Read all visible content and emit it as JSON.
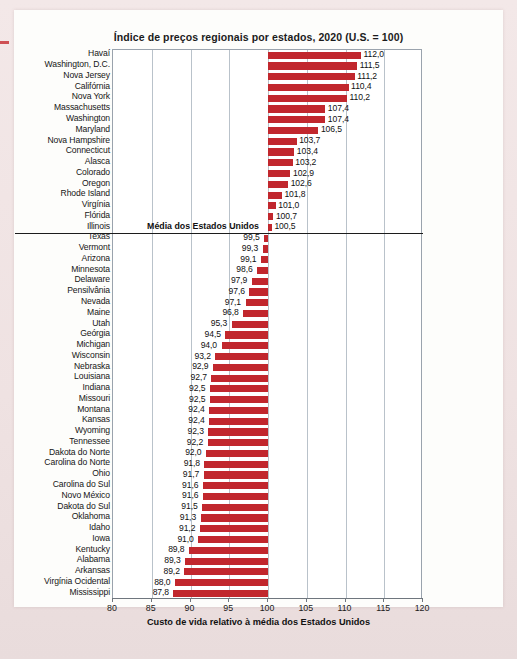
{
  "figure": {
    "title": "Índice de preços regionais por estados, 2020 (U.S. = 100)",
    "x_caption": "Custo de vida relativo à média dos Estados Unidos",
    "average_label": "Média dos Estados Unidos",
    "bar_color": "#c1272d",
    "grid_color": "#b9c2ca"
  },
  "chart_data": {
    "type": "bar",
    "orientation": "horizontal",
    "title": "Índice de preços regionais por estados, 2020 (U.S. = 100)",
    "xlabel": "Custo de vida relativo à média dos Estados Unidos",
    "ylabel": "",
    "xlim": [
      80,
      120
    ],
    "xticks": [
      80,
      85,
      90,
      95,
      100,
      105,
      110,
      115,
      120
    ],
    "xtick_labels": [
      "80",
      "85",
      "90",
      "95",
      "100",
      "105",
      "110",
      "115",
      "120"
    ],
    "baseline": 100,
    "grid": true,
    "legend": null,
    "annotations": [
      {
        "text": "Média dos Estados Unidos",
        "at_value": 100,
        "after_category": "Illinois"
      }
    ],
    "categories": [
      "Havaí",
      "Washington, D.C.",
      "Nova Jersey",
      "Califórnia",
      "Nova York",
      "Massachusetts",
      "Washington",
      "Maryland",
      "Nova Hampshire",
      "Connecticut",
      "Alasca",
      "Colorado",
      "Oregon",
      "Rhode Island",
      "Virgínia",
      "Flórida",
      "Illinois",
      "Texas",
      "Vermont",
      "Arizona",
      "Minnesota",
      "Delaware",
      "Pensilvânia",
      "Nevada",
      "Maine",
      "Utah",
      "Geórgia",
      "Michigan",
      "Wisconsin",
      "Nebraska",
      "Louisiana",
      "Indiana",
      "Missouri",
      "Montana",
      "Kansas",
      "Wyoming",
      "Tennessee",
      "Dakota do Norte",
      "Carolina do Norte",
      "Ohio",
      "Carolina do Sul",
      "Novo México",
      "Dakota do Sul",
      "Oklahoma",
      "Idaho",
      "Iowa",
      "Kentucky",
      "Alabama",
      "Arkansas",
      "Virgínia Ocidental",
      "Mississippi"
    ],
    "values": [
      112.0,
      111.5,
      111.2,
      110.4,
      110.2,
      107.4,
      107.4,
      106.5,
      103.7,
      103.4,
      103.2,
      102.9,
      102.6,
      101.8,
      101.0,
      100.7,
      100.5,
      99.5,
      99.3,
      99.1,
      98.6,
      97.9,
      97.6,
      97.1,
      96.8,
      95.3,
      94.5,
      94.0,
      93.2,
      92.9,
      92.7,
      92.5,
      92.5,
      92.4,
      92.4,
      92.3,
      92.2,
      92.0,
      91.8,
      91.7,
      91.6,
      91.6,
      91.5,
      91.3,
      91.2,
      91.0,
      89.8,
      89.3,
      89.2,
      88.0,
      87.8
    ],
    "value_labels": [
      "112,0",
      "111,5",
      "111,2",
      "110,4",
      "110,2",
      "107,4",
      "107,4",
      "106,5",
      "103,7",
      "103,4",
      "103,2",
      "102,9",
      "102,6",
      "101,8",
      "101,0",
      "100,7",
      "100,5",
      "99,5",
      "99,3",
      "99,1",
      "98,6",
      "97,9",
      "97,6",
      "97,1",
      "96,8",
      "95,3",
      "94,5",
      "94,0",
      "93,2",
      "92,9",
      "92,7",
      "92,5",
      "92,5",
      "92,4",
      "92,4",
      "92,3",
      "92,2",
      "92,0",
      "91,8",
      "91,7",
      "91,6",
      "91,6",
      "91,5",
      "91,3",
      "91,2",
      "91,0",
      "89,8",
      "89,3",
      "89,2",
      "88,0",
      "87,8"
    ]
  }
}
